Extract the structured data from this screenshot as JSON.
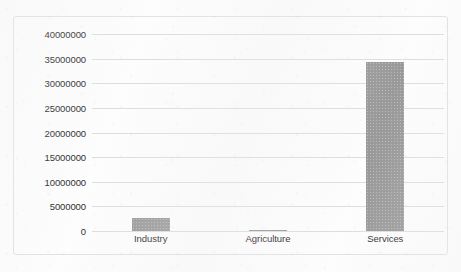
{
  "chart_data": {
    "type": "bar",
    "title": "",
    "xlabel": "",
    "ylabel": "",
    "categories": [
      "Industry",
      "Agriculture",
      "Services"
    ],
    "values": [
      2600000,
      150000,
      34300000
    ],
    "series": [
      {
        "name": "",
        "values": [
          2600000,
          150000,
          34300000
        ]
      }
    ],
    "ylim": [
      0,
      40000000
    ],
    "ytick_labels": [
      "40000000",
      "35000000",
      "30000000",
      "25000000",
      "20000000",
      "15000000",
      "10000000",
      "5000000",
      "0"
    ],
    "ytick_values": [
      40000000,
      35000000,
      30000000,
      25000000,
      20000000,
      15000000,
      10000000,
      5000000,
      0
    ],
    "grid": true,
    "legend": false,
    "legend_position": "none",
    "bar_color": "#9b9b9b",
    "gridline_color": "#dededf",
    "border_color": "#e2e2e4",
    "background_color": "#fdfdfd",
    "text_color": "#2b2b2b"
  }
}
